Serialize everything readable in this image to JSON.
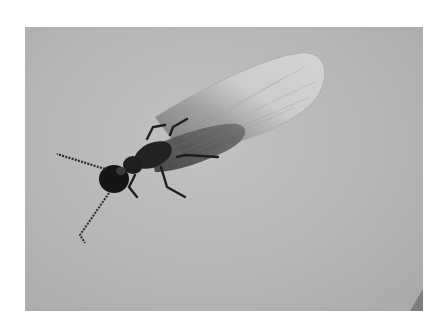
{
  "image": {
    "subject": "winged termite (alate) on a plain gray surface",
    "style": "grayscale photograph",
    "colors": {
      "page_background": "#ffffff",
      "photo_background": "#b6b6b6",
      "insect_body": "#1a1a1a",
      "wing_light": "#d4d4d4",
      "wing_dark": "#555555"
    }
  }
}
